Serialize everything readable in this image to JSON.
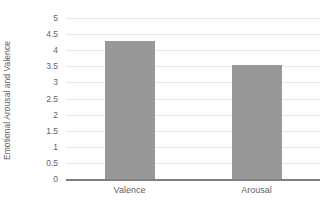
{
  "chart_data": {
    "type": "bar",
    "title": "",
    "subtitle": "",
    "xlabel": "",
    "ylabel": "Emotional Arousal and Valence",
    "categories": [
      "Valence",
      "Arousal"
    ],
    "values": [
      4.3,
      3.55
    ],
    "series": [
      {
        "name": "Emotional Arousal and Valence",
        "values": [
          4.3,
          3.55
        ]
      }
    ],
    "ylim": [
      0,
      5
    ],
    "ytick_labels": [
      "5",
      "4.5",
      "4",
      "3.5",
      "3",
      "2.5",
      "2",
      "1.5",
      "1",
      "0.5",
      "0"
    ],
    "ytick_values": [
      5,
      4.5,
      4,
      3.5,
      3,
      2.5,
      2,
      1.5,
      1,
      0.5,
      0
    ],
    "grid": true,
    "legend": false,
    "legend_position": "none",
    "bar_color": "#989898",
    "grid_color": "#e8e8e8",
    "axis_color": "#7f7f7f",
    "text_color": "#636363",
    "background_color": "#ffffff"
  }
}
